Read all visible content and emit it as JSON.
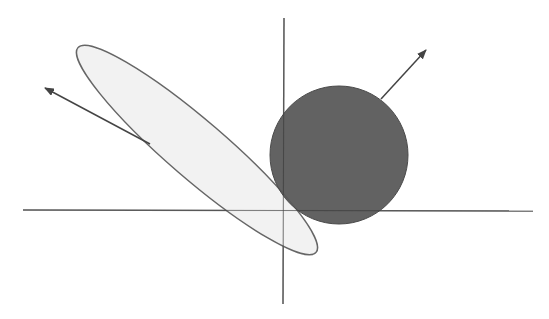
{
  "diagram": {
    "colors": {
      "background": "#ffffff",
      "axis": "#777777",
      "ellipse_fill": "#f0f0f0",
      "ellipse_stroke": "#666666",
      "circle_fill": "#5a5a5a",
      "circle_stroke": "#4a4a4a",
      "arrow": "#444444"
    },
    "axes": {
      "horizontal": {
        "x1": 23,
        "y1": 210,
        "x2": 533,
        "y2": 211
      },
      "vertical": {
        "x1": 284,
        "y1": 18,
        "x2": 283,
        "y2": 304
      }
    },
    "ellipse": {
      "cx": 197,
      "cy": 150,
      "rx": 157,
      "ry": 29,
      "rotation_deg": 40.7
    },
    "circle": {
      "cx": 339,
      "cy": 155,
      "r": 69
    },
    "arrows": [
      {
        "name": "ellipse-normal",
        "x1": 150,
        "y1": 144,
        "x2": 45,
        "y2": 88
      },
      {
        "name": "circle-normal",
        "x1": 381,
        "y1": 99,
        "x2": 426,
        "y2": 50
      }
    ]
  }
}
